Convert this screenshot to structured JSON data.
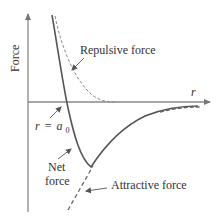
{
  "diagram": {
    "type": "force-vs-distance",
    "axes": {
      "y_label": "Force",
      "x_label": "r"
    },
    "curves": [
      {
        "name": "Repulsive force",
        "style": "dashed"
      },
      {
        "name": "Net force",
        "style": "solid"
      },
      {
        "name": "Attractive force",
        "style": "dashed"
      }
    ],
    "annotations": {
      "repulsive": "Repulsive force",
      "attractive": "Attractive force",
      "net_line1": "Net",
      "net_line2": "force",
      "equilibrium_r": "r",
      "equilibrium_eq": "=",
      "equilibrium_a": "a",
      "equilibrium_sub": "0"
    },
    "colors": {
      "axis": "#888888",
      "curve": "#555555",
      "dashed": "#888888",
      "text": "#333333"
    }
  }
}
